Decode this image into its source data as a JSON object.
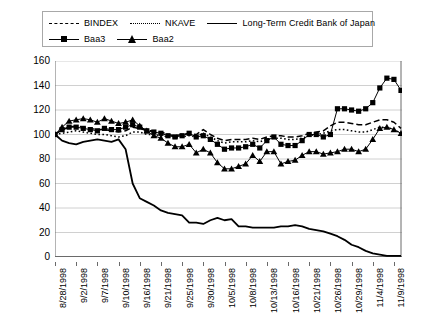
{
  "legend": {
    "rows": [
      [
        {
          "label": "BINDEX",
          "style": "dash"
        },
        {
          "label": "NKAVE",
          "style": "dot"
        },
        {
          "label": "Long-Term Credit Bank of Japan",
          "style": "solid"
        }
      ],
      [
        {
          "label": "Baa3",
          "style": "square"
        },
        {
          "label": "Baa2",
          "style": "triangle"
        }
      ]
    ]
  },
  "chart_data": {
    "type": "line",
    "title": "",
    "xlabel": "",
    "ylabel": "",
    "ylim": [
      0,
      160
    ],
    "yticks": [
      0,
      20,
      40,
      60,
      80,
      100,
      120,
      140,
      160
    ],
    "grid": true,
    "legend_position": "top",
    "x": [
      "8/28/1998",
      "8/31/1998",
      "9/1/1998",
      "9/2/1998",
      "9/3/1998",
      "9/4/1998",
      "9/7/1998",
      "9/8/1998",
      "9/9/1998",
      "9/10/1998",
      "9/11/1998",
      "9/14/1998",
      "9/16/1998",
      "9/17/1998",
      "9/18/1998",
      "9/21/1998",
      "9/22/1998",
      "9/24/1998",
      "9/25/1998",
      "9/28/1998",
      "9/29/1998",
      "9/30/1998",
      "10/1/1998",
      "10/2/1998",
      "10/5/1998",
      "10/6/1998",
      "10/7/1998",
      "10/8/1998",
      "10/9/1998",
      "10/12/1998",
      "10/13/1998",
      "10/14/1998",
      "10/15/1998",
      "10/16/1998",
      "10/19/1998",
      "10/20/1998",
      "10/21/1998",
      "10/22/1998",
      "10/23/1998",
      "10/26/1998",
      "10/27/1998",
      "10/28/1998",
      "10/29/1998",
      "10/30/1998",
      "11/2/1998",
      "11/4/1998",
      "11/5/1998",
      "11/6/1998",
      "11/9/1998",
      "11/10/1998"
    ],
    "xtick_labels": [
      "8/28/1998",
      "9/2/1998",
      "9/7/1998",
      "9/10/1998",
      "9/16/1998",
      "9/21/1998",
      "9/25/1998",
      "9/30/1998",
      "10/5/1998",
      "10/8/1998",
      "10/13/1998",
      "10/16/1998",
      "10/21/1998",
      "10/26/1998",
      "10/29/1998",
      "11/4/1998",
      "11/9/1998"
    ],
    "xtick_indices": [
      0,
      3,
      6,
      9,
      12,
      15,
      18,
      21,
      24,
      27,
      30,
      33,
      36,
      39,
      42,
      45,
      48
    ],
    "series": [
      {
        "name": "BINDEX",
        "style": "dash",
        "values": [
          100,
          104,
          106,
          107,
          106,
          105,
          104,
          104,
          103,
          102,
          103,
          106,
          105,
          103,
          103,
          102,
          100,
          99,
          100,
          101,
          100,
          104,
          100,
          97,
          95,
          96,
          96,
          96,
          97,
          96,
          98,
          99,
          99,
          98,
          98,
          99,
          101,
          102,
          103,
          107,
          110,
          110,
          109,
          108,
          108,
          110,
          112,
          112,
          110,
          105
        ]
      },
      {
        "name": "NKAVE",
        "style": "dot",
        "values": [
          100,
          101,
          102,
          103,
          102,
          101,
          100,
          100,
          99,
          98,
          99,
          102,
          102,
          100,
          100,
          99,
          98,
          97,
          98,
          99,
          98,
          101,
          98,
          95,
          93,
          94,
          94,
          94,
          95,
          94,
          96,
          97,
          97,
          96,
          96,
          97,
          99,
          100,
          101,
          103,
          104,
          104,
          103,
          102,
          102,
          104,
          106,
          106,
          104,
          101
        ]
      },
      {
        "name": "Long-Term Credit Bank of Japan",
        "style": "solid",
        "values": [
          100,
          95,
          93,
          92,
          94,
          95,
          96,
          95,
          94,
          96,
          88,
          60,
          48,
          45,
          42,
          38,
          36,
          35,
          34,
          28,
          28,
          27,
          30,
          32,
          30,
          31,
          25,
          25,
          24,
          24,
          24,
          24,
          25,
          25,
          26,
          25,
          23,
          22,
          21,
          19,
          17,
          14,
          10,
          8,
          5,
          3,
          2,
          1,
          1,
          1
        ]
      },
      {
        "name": "Baa3",
        "style": "square",
        "values": [
          100,
          104,
          106,
          106,
          105,
          104,
          103,
          105,
          104,
          104,
          106,
          108,
          106,
          103,
          102,
          101,
          99,
          98,
          99,
          101,
          98,
          99,
          96,
          92,
          88,
          89,
          89,
          90,
          92,
          89,
          95,
          98,
          92,
          91,
          91,
          95,
          100,
          100,
          98,
          100,
          121,
          121,
          120,
          119,
          121,
          126,
          138,
          146,
          145,
          136
        ]
      },
      {
        "name": "Baa2",
        "style": "triangle",
        "values": [
          100,
          106,
          111,
          112,
          113,
          112,
          110,
          113,
          111,
          109,
          110,
          112,
          107,
          103,
          99,
          97,
          93,
          90,
          90,
          92,
          85,
          88,
          85,
          77,
          72,
          72,
          74,
          76,
          83,
          78,
          86,
          86,
          76,
          78,
          79,
          83,
          86,
          86,
          84,
          85,
          86,
          88,
          88,
          86,
          88,
          96,
          105,
          106,
          104,
          101
        ]
      }
    ]
  }
}
